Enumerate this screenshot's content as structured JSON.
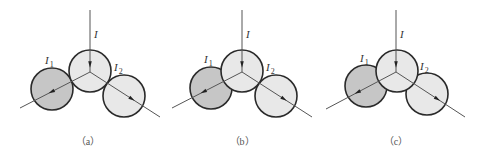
{
  "colors": {
    "stroke": "#2a2a2a",
    "line": "#555555",
    "dark_fill": "#c6c6c6",
    "light_fill": "#e8e8e8",
    "background": "#ffffff"
  },
  "labels": {
    "incoming": "I",
    "branch1": "I",
    "branch1_sub": "1",
    "branch2": "I",
    "branch2_sub": "2"
  },
  "panels": [
    {
      "caption": "（a）",
      "incoming_line": {
        "x1": 90,
        "y1": 10,
        "x2": 90,
        "y2": 72
      },
      "exit_line": {
        "x1": 20,
        "y1": 108,
        "x2": 90,
        "y2": 72,
        "x3": 160,
        "y3": 117
      },
      "center_circle": {
        "cx": 90,
        "cy": 71,
        "r": 21
      },
      "left_circle": {
        "cx": 52,
        "cy": 89,
        "r": 21
      },
      "right_circle": {
        "cx": 124,
        "cy": 96,
        "r": 21
      },
      "label_I": {
        "x": 94,
        "y": 38
      },
      "label_I1": {
        "x": 45,
        "y": 64
      },
      "label_I2": {
        "x": 114,
        "y": 71
      },
      "caption_pos": {
        "x": 88,
        "y": 145
      }
    },
    {
      "caption": "（b）",
      "incoming_line": {
        "x1": 242,
        "y1": 10,
        "x2": 242,
        "y2": 72
      },
      "exit_line": {
        "x1": 172,
        "y1": 108,
        "x2": 242,
        "y2": 72,
        "x3": 312,
        "y3": 117
      },
      "center_circle": {
        "cx": 242,
        "cy": 71,
        "r": 21
      },
      "left_circle": {
        "cx": 211,
        "cy": 88,
        "r": 21
      },
      "right_circle": {
        "cx": 276,
        "cy": 96,
        "r": 21
      },
      "label_I": {
        "x": 246,
        "y": 38
      },
      "label_I1": {
        "x": 204,
        "y": 63
      },
      "label_I2": {
        "x": 266,
        "y": 71
      },
      "caption_pos": {
        "x": 242,
        "y": 145
      }
    },
    {
      "caption": "（c）",
      "incoming_line": {
        "x1": 396,
        "y1": 10,
        "x2": 396,
        "y2": 72
      },
      "exit_line": {
        "x1": 326,
        "y1": 109,
        "x2": 396,
        "y2": 72,
        "x3": 465,
        "y3": 117
      },
      "center_circle": {
        "cx": 397,
        "cy": 71,
        "r": 21
      },
      "left_circle": {
        "cx": 366,
        "cy": 86,
        "r": 21
      },
      "right_circle": {
        "cx": 427,
        "cy": 94,
        "r": 21
      },
      "label_I": {
        "x": 400,
        "y": 38
      },
      "label_I1": {
        "x": 360,
        "y": 62
      },
      "label_I2": {
        "x": 420,
        "y": 70
      },
      "caption_pos": {
        "x": 396,
        "y": 145
      }
    }
  ]
}
